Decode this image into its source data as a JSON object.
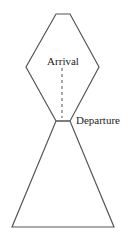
{
  "diagram": {
    "type": "hourglass-shape",
    "colors": {
      "stroke": "#555555",
      "background": "#ffffff",
      "text": "#222222"
    },
    "shapes": {
      "upper_hexagon": {
        "points": [
          [
            56,
            14
          ],
          [
            70,
            14
          ],
          [
            99,
            67
          ],
          [
            70,
            121
          ],
          [
            56,
            121
          ],
          [
            26,
            67
          ]
        ]
      },
      "lower_triangle": {
        "points": [
          [
            56,
            121
          ],
          [
            70,
            121
          ],
          [
            114,
            227
          ],
          [
            12,
            227
          ]
        ]
      },
      "dashed_connector": {
        "x": 62,
        "y1": 68,
        "y2": 118
      }
    },
    "labels": {
      "arrival": "Arrival",
      "departure": "Departure"
    }
  }
}
